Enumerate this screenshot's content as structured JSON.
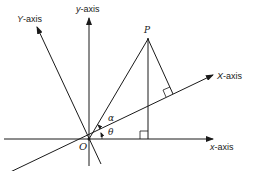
{
  "diagram": {
    "labels": {
      "Y_axis": {
        "var": "Y",
        "suffix": "-axis"
      },
      "y_axis": {
        "var": "y",
        "suffix": "-axis"
      },
      "X_axis": {
        "var": "X",
        "suffix": "-axis"
      },
      "x_axis": {
        "var": "x",
        "suffix": "-axis"
      },
      "point_P": "P",
      "origin_O": "O",
      "angle_alpha": "α",
      "angle_theta": "θ"
    },
    "colors": {
      "stroke": "#1a1a1a",
      "background": "#ffffff"
    }
  }
}
